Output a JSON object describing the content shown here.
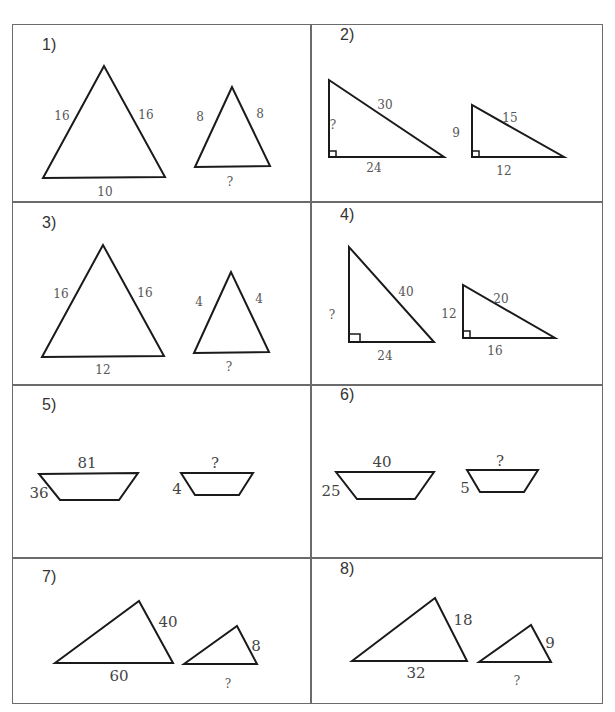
{
  "worksheet": {
    "problems": [
      {
        "number": "1)",
        "figure": "isosceles-triangle-pair",
        "large": {
          "left_side": "16",
          "right_side": "16",
          "base": "10"
        },
        "small": {
          "left_side": "8",
          "right_side": "8",
          "base": "?"
        }
      },
      {
        "number": "2)",
        "figure": "right-triangle-pair",
        "large": {
          "leg_vertical": "?",
          "hypotenuse": "30",
          "leg_horizontal": "24"
        },
        "small": {
          "leg_vertical": "9",
          "hypotenuse": "15",
          "leg_horizontal": "12"
        }
      },
      {
        "number": "3)",
        "figure": "isosceles-triangle-pair",
        "large": {
          "left_side": "16",
          "right_side": "16",
          "base": "12"
        },
        "small": {
          "left_side": "4",
          "right_side": "4",
          "base": "?"
        }
      },
      {
        "number": "4)",
        "figure": "right-triangle-pair",
        "large": {
          "leg_vertical": "?",
          "hypotenuse": "40",
          "leg_horizontal": "24"
        },
        "small": {
          "leg_vertical": "12",
          "hypotenuse": "20",
          "leg_horizontal": "16"
        }
      },
      {
        "number": "5)",
        "figure": "trapezoid-pair",
        "large": {
          "top": "81",
          "left_side": "36"
        },
        "small": {
          "top": "?",
          "left_side": "4"
        }
      },
      {
        "number": "6)",
        "figure": "trapezoid-pair",
        "large": {
          "top": "40",
          "left_side": "25"
        },
        "small": {
          "top": "?",
          "left_side": "5"
        }
      },
      {
        "number": "7)",
        "figure": "scalene-triangle-pair",
        "large": {
          "right_side": "40",
          "base": "60"
        },
        "small": {
          "right_side": "8",
          "base": "?"
        }
      },
      {
        "number": "8)",
        "figure": "scalene-triangle-pair",
        "large": {
          "right_side": "18",
          "base": "32"
        },
        "small": {
          "right_side": "9",
          "base": "?"
        }
      }
    ]
  }
}
